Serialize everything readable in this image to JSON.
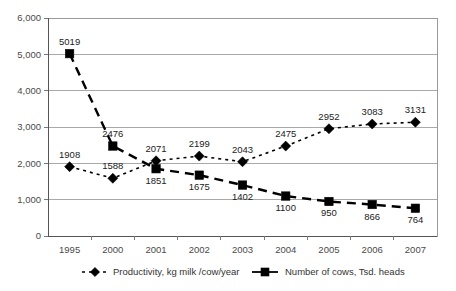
{
  "chart_data": {
    "type": "line",
    "title": "",
    "subtitle": "",
    "xlabel": "",
    "ylabel": "",
    "categories": [
      "1995",
      "2000",
      "2001",
      "2002",
      "2003",
      "2004",
      "2005",
      "2006",
      "2007"
    ],
    "ylim": [
      0,
      6000
    ],
    "ytick_labels": [
      "0",
      "1,000",
      "2,000",
      "3,000",
      "4,000",
      "5,000",
      "6,000"
    ],
    "ytick_values": [
      0,
      1000,
      2000,
      3000,
      4000,
      5000,
      6000
    ],
    "grid": true,
    "legend_position": "bottom",
    "series": [
      {
        "name": "Productivity, kg milk /cow/year",
        "marker": "diamond",
        "linestyle": "dotted",
        "color": "#000000",
        "values": [
          1908,
          1588,
          2071,
          2199,
          2043,
          2475,
          2952,
          3083,
          3131
        ],
        "labels": [
          "1908",
          "1588",
          "2071",
          "2199",
          "2043",
          "2475",
          "2952",
          "3083",
          "3131"
        ],
        "label_positions": [
          "above",
          "above",
          "above",
          "above",
          "above",
          "above",
          "above",
          "above",
          "above"
        ]
      },
      {
        "name": "Number of cows, Tsd. heads",
        "marker": "square",
        "linestyle": "dashed",
        "color": "#000000",
        "values": [
          5019,
          2476,
          1851,
          1675,
          1402,
          1100,
          950,
          866,
          764
        ],
        "labels": [
          "5019",
          "2476",
          "1851",
          "1675",
          "1402",
          "1100",
          "950",
          "866",
          "764"
        ],
        "label_positions": [
          "above",
          "above",
          "below",
          "below",
          "below",
          "below",
          "below",
          "below",
          "below"
        ]
      }
    ]
  },
  "legend": {
    "entries": [
      {
        "label": "Productivity, kg milk /cow/year",
        "marker": "diamond-marker",
        "line": "dotted"
      },
      {
        "label": "Number of cows, Tsd. heads",
        "marker": "square-marker",
        "line": "solid"
      }
    ]
  }
}
